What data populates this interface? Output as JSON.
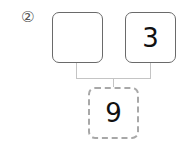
{
  "problem": {
    "number_label": "②",
    "left_box": {
      "value": ""
    },
    "right_box": {
      "value": "3"
    },
    "result_box": {
      "value": "9"
    }
  },
  "colors": {
    "box_border": "#6a6a6a",
    "dashed_border": "#a8a8a8",
    "connector": "#c4c4c4"
  }
}
